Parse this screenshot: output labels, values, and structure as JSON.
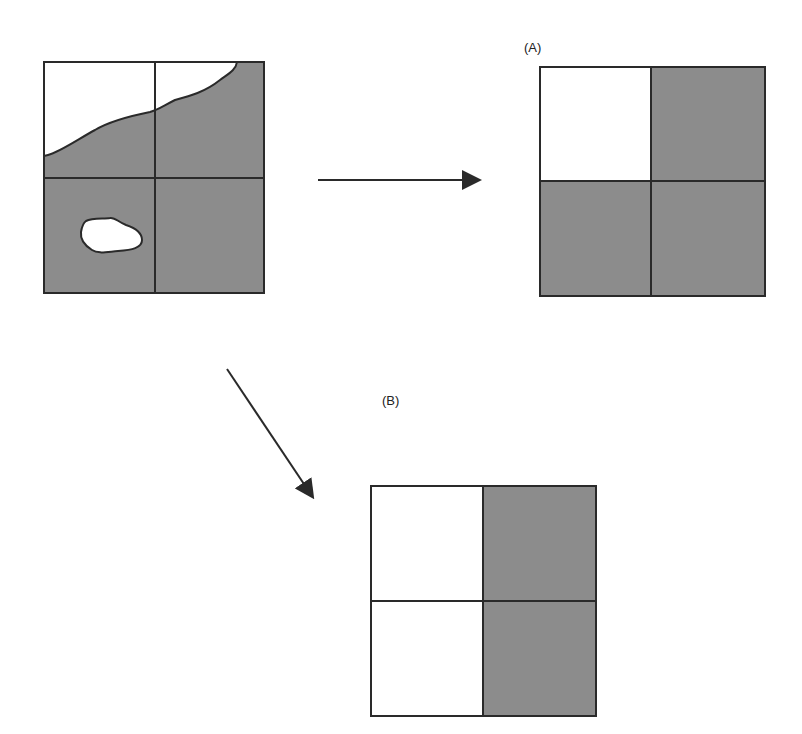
{
  "figure": {
    "type": "raster-cell-classification",
    "colors": {
      "gray": "#8c8c8c",
      "white": "#ffffff",
      "line": "#2a2a2a"
    },
    "source_grid": {
      "rows": 2,
      "cols": 2,
      "description": "Continuous map with coastline boundary and small island overlaid on 2x2 grid"
    },
    "result_A": {
      "label": "(A)",
      "cells": [
        [
          "white",
          "gray"
        ],
        [
          "gray",
          "gray"
        ]
      ]
    },
    "result_B": {
      "label": "(B)",
      "cells": [
        [
          "white",
          "gray"
        ],
        [
          "white",
          "gray"
        ]
      ]
    },
    "arrows": [
      {
        "from": "source_grid",
        "to": "result_A",
        "direction": "right"
      },
      {
        "from": "source_grid",
        "to": "result_B",
        "direction": "down-right"
      }
    ]
  }
}
